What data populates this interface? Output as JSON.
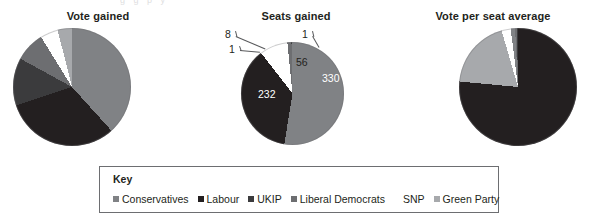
{
  "page": {
    "background": "#ffffff",
    "top_cropped_text": "g    g   p y"
  },
  "palette": {
    "conservatives": "#808285",
    "labour": "#231f20",
    "ukip": "#3b3b3d",
    "liberal_democrats": "#6d6e71",
    "snp": "#ffffff",
    "green_party": "#a7a9ac",
    "outline": "#6d6e71",
    "text": "#231f20",
    "leader_line": "#58595b"
  },
  "legend": {
    "title": "Key",
    "items": [
      {
        "label": "Conservatives",
        "color": "#808285",
        "has_swatch": true
      },
      {
        "label": "Labour",
        "color": "#231f20",
        "has_swatch": true
      },
      {
        "label": "UKIP",
        "color": "#3b3b3d",
        "has_swatch": true
      },
      {
        "label": "Liberal Democrats",
        "color": "#6d6e71",
        "has_swatch": true
      },
      {
        "label": "SNP",
        "color": "#ffffff",
        "has_swatch": true
      },
      {
        "label": "Green Party",
        "color": "#a7a9ac",
        "has_swatch": true
      }
    ]
  },
  "chart_data": [
    {
      "type": "pie",
      "title": "Vote gained",
      "categories": [
        "Conservatives",
        "Labour",
        "UKIP",
        "Liberal Democrats",
        "SNP",
        "Green Party"
      ],
      "values": [
        36.9,
        30.4,
        12.6,
        7.9,
        4.7,
        3.8
      ],
      "colors": [
        "#808285",
        "#231f20",
        "#3b3b3d",
        "#6d6e71",
        "#ffffff",
        "#a7a9ac"
      ],
      "labels_shown": false,
      "data_labels": [],
      "start_angle": 0,
      "legend_position": "bottom-shared",
      "grid": false
    },
    {
      "type": "pie",
      "title": "Seats gained",
      "categories": [
        "Conservatives",
        "Labour",
        "SNP",
        "Liberal Democrats",
        "UKIP",
        "Green Party"
      ],
      "values": [
        330,
        232,
        56,
        8,
        1,
        1
      ],
      "colors": [
        "#808285",
        "#231f20",
        "#ffffff",
        "#6d6e71",
        "#3b3b3d",
        "#a7a9ac"
      ],
      "labels_shown": true,
      "data_labels": [
        {
          "text": "330",
          "value": 330,
          "category": "Conservatives",
          "style": "inside-dark"
        },
        {
          "text": "232",
          "value": 232,
          "category": "Labour",
          "style": "inside-dark"
        },
        {
          "text": "56",
          "value": 56,
          "category": "SNP",
          "style": "inside-light"
        },
        {
          "text": "8",
          "value": 8,
          "category": "Liberal Democrats",
          "style": "callout"
        },
        {
          "text": "1",
          "value": 1,
          "category": "UKIP",
          "style": "callout"
        },
        {
          "text": "1",
          "value": 1,
          "category": "Green Party",
          "style": "callout"
        }
      ],
      "start_angle": 0,
      "legend_position": "bottom-shared",
      "grid": false
    },
    {
      "type": "pie",
      "title": "Vote per seat average",
      "categories": [
        "Conservatives",
        "Labour",
        "UKIP",
        "Liberal Democrats",
        "SNP",
        "Green Party"
      ],
      "values": [
        76.5,
        19.0,
        2.5,
        1.2,
        0.5,
        0.3
      ],
      "colors": [
        "#231f20",
        "#a7a9ac",
        "#ffffff",
        "#808285",
        "#6d6e71",
        "#3b3b3d"
      ],
      "labels_shown": false,
      "data_labels": [],
      "start_angle": 0,
      "legend_position": "bottom-shared",
      "grid": false
    }
  ]
}
